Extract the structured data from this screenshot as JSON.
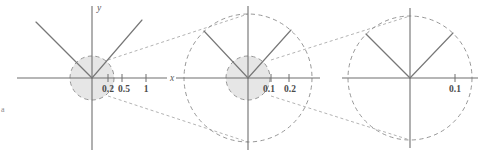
{
  "figure": {
    "background_color": "#ffffff",
    "width": 494,
    "height": 156,
    "corner_mark": "a"
  },
  "style": {
    "axis_color": "#6f6f6f",
    "ray_color": "#777777",
    "dashed_circle_color": "#8b8b8b",
    "connector_color": "#9a9a9a",
    "shade_fill": "#e6e6e6",
    "label_color": "#4a4a4a"
  },
  "panels": [
    {
      "id": "panel-1",
      "name": "overview-panel",
      "origin": {
        "x": 92,
        "y": 78
      },
      "axes": {
        "x_label": "x",
        "y_label": "y",
        "x_start": -75,
        "x_end": 75,
        "y_start": -72,
        "y_end": 72
      },
      "ticks": [
        {
          "label": "0.2",
          "x_offset": 16
        },
        {
          "label": "0.5",
          "x_offset": 30
        },
        {
          "label": "1",
          "x_offset": 54
        }
      ],
      "shaded_circle": {
        "radius": 22,
        "shaded": true
      },
      "rays": [
        {
          "name": "ray-upper-left",
          "dx": -56,
          "dy": -56
        },
        {
          "name": "ray-upper-right",
          "dx": 50,
          "dy": -58
        }
      ]
    },
    {
      "id": "panel-2",
      "name": "first-magnification-panel",
      "origin": {
        "x": 248,
        "y": 78
      },
      "axes": {
        "x_label": "",
        "y_label": "",
        "x_start": -72,
        "x_end": 72,
        "y_start": -72,
        "y_end": 72
      },
      "ticks": [
        {
          "label": "0.1",
          "x_offset": 23
        },
        {
          "label": "0.2",
          "x_offset": 41
        }
      ],
      "outer_circle": {
        "radius": 64,
        "shaded": false
      },
      "shaded_circle": {
        "radius": 22,
        "shaded": true
      },
      "rays": [
        {
          "name": "ray-upper-left",
          "dx": -44,
          "dy": -47
        },
        {
          "name": "ray-upper-right",
          "dx": 43,
          "dy": -48
        }
      ]
    },
    {
      "id": "panel-3",
      "name": "second-magnification-panel",
      "origin": {
        "x": 410,
        "y": 78
      },
      "axes": {
        "x_label": "",
        "y_label": "",
        "x_start": -68,
        "x_end": 68,
        "y_start": -70,
        "y_end": 70
      },
      "ticks": [
        {
          "label": "0.1",
          "x_offset": 45
        }
      ],
      "outer_circle": {
        "radius": 62,
        "shaded": false
      },
      "rays": [
        {
          "name": "ray-upper-left",
          "dx": -44,
          "dy": -44
        },
        {
          "name": "ray-upper-right",
          "dx": 43,
          "dy": -45
        }
      ]
    }
  ],
  "connectors": [
    {
      "name": "connector-1-top",
      "from": {
        "x": 108,
        "y": 60
      },
      "to": {
        "x": 248,
        "y": 14
      }
    },
    {
      "name": "connector-1-bottom",
      "from": {
        "x": 108,
        "y": 96
      },
      "to": {
        "x": 248,
        "y": 142
      }
    },
    {
      "name": "connector-2-top",
      "from": {
        "x": 271,
        "y": 60
      },
      "to": {
        "x": 410,
        "y": 16
      }
    },
    {
      "name": "connector-2-bottom",
      "from": {
        "x": 271,
        "y": 96
      },
      "to": {
        "x": 410,
        "y": 140
      }
    }
  ]
}
